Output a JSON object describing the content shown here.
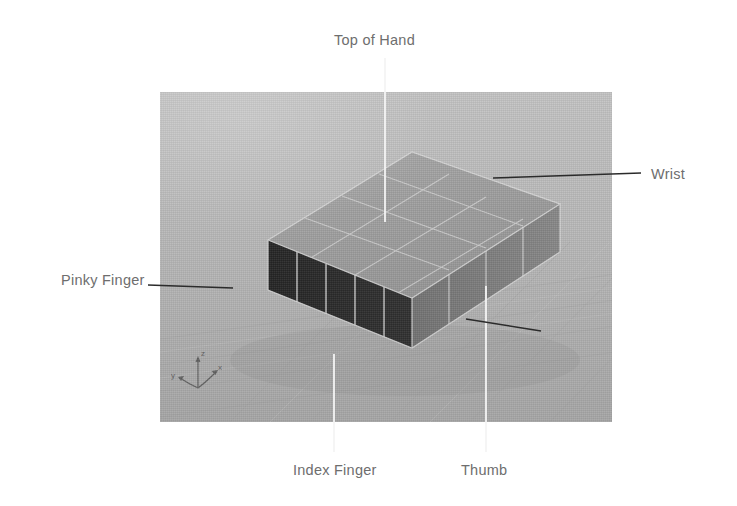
{
  "scene": {
    "title": "Hand base mesh blockout viewport",
    "background_color": "#b6b6b6",
    "viewport": {
      "x": 160,
      "y": 92,
      "width": 452,
      "height": 330
    },
    "mesh": {
      "name": "hand-block",
      "top_face_color": "#9e9e9e",
      "front_dark_face_color": "#2a2a2a",
      "right_face_color": "#7e7e7e",
      "edge_color": "#d8d8d8",
      "top_face_grid": {
        "columns": 4,
        "rows": 3
      },
      "finger_face_panels": 5
    },
    "axis_gizmo": {
      "name": "axis-gizmo",
      "z_label": "z",
      "x_label": "x",
      "y_label": "y"
    }
  },
  "annotations": [
    {
      "id": "top-of-hand",
      "label": "Top of Hand",
      "label_x": 334,
      "label_y": 32,
      "leader": {
        "x1": 385,
        "y1": 58,
        "x2": 385,
        "y2": 222,
        "color": "#f2f2f2"
      }
    },
    {
      "id": "wrist",
      "label": "Wrist",
      "label_x": 651,
      "label_y": 166,
      "leader": {
        "x1": 493,
        "y1": 178,
        "x2": 641,
        "y2": 173,
        "color": "#2b2b2b"
      }
    },
    {
      "id": "pinky-finger",
      "label": "Pinky Finger",
      "label_x": 61,
      "label_y": 272,
      "leader": {
        "x1": 148,
        "y1": 285,
        "x2": 232,
        "y2": 288,
        "color": "#2b2b2b"
      }
    },
    {
      "id": "index-finger",
      "label": "Index Finger",
      "label_x": 293,
      "label_y": 462,
      "leader": {
        "x1": 334,
        "y1": 354,
        "x2": 334,
        "y2": 452,
        "color": "#f2f2f2"
      }
    },
    {
      "id": "thumb",
      "label": "Thumb",
      "label_x": 461,
      "label_y": 462,
      "leader": {
        "x1": 486,
        "y1": 286,
        "x2": 486,
        "y2": 452,
        "color": "#f2f2f2"
      }
    },
    {
      "id": "thumb-pointer",
      "label": "",
      "leader": {
        "x1": 466,
        "y1": 319,
        "x2": 540,
        "y2": 330,
        "color": "#2b2b2b"
      }
    }
  ]
}
